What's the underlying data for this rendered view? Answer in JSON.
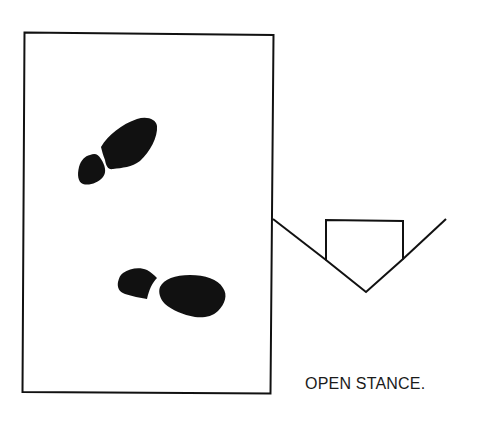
{
  "diagram": {
    "title": "Open stance",
    "caption": "OPEN STANCE.",
    "colors": {
      "ink": "#111111",
      "background": "#ffffff"
    },
    "elements": [
      {
        "name": "batters-box",
        "type": "rectangle"
      },
      {
        "name": "front-footprint",
        "type": "shoe-print",
        "position": "upper"
      },
      {
        "name": "back-footprint",
        "type": "shoe-print",
        "position": "lower"
      },
      {
        "name": "home-plate",
        "type": "pentagon"
      },
      {
        "name": "foul-lines",
        "type": "v-lines"
      }
    ]
  }
}
